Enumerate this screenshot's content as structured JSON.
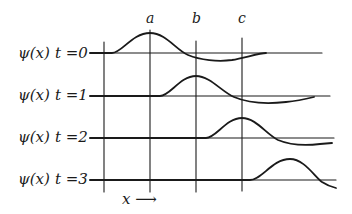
{
  "diagram": {
    "type": "wave-packet-time-evolution",
    "markers": [
      {
        "label": "a",
        "x": 150
      },
      {
        "label": "b",
        "x": 196
      },
      {
        "label": "c",
        "x": 242
      }
    ],
    "grid_verticals_x": [
      104,
      150,
      196,
      242
    ],
    "rows": [
      {
        "func": "ψ(x)",
        "time": "t =0",
        "baseline_y": 53
      },
      {
        "func": "ψ(x)",
        "time": "t =1",
        "baseline_y": 96
      },
      {
        "func": "ψ(x)",
        "time": "t =2",
        "baseline_y": 138
      },
      {
        "func": "ψ(x)",
        "time": "t =3",
        "baseline_y": 180
      }
    ],
    "x_axis_label": "x ⟶",
    "colors": {
      "ink": "#1a1a1a",
      "background": "#ffffff"
    }
  }
}
